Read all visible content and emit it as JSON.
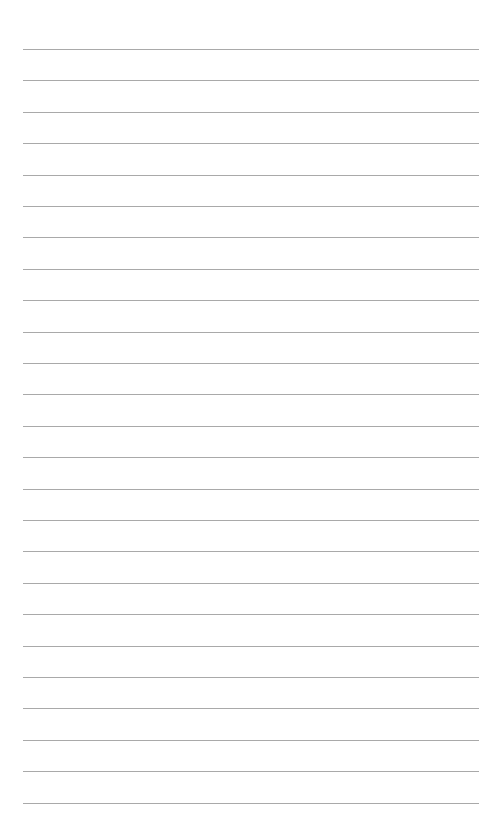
{
  "page": {
    "type": "lined-paper",
    "background_color": "#ffffff",
    "line_color": "#a9a9a9",
    "line_count": 25,
    "first_line_y": 49,
    "line_spacing": 31.4,
    "line_left": 23,
    "line_width": 456
  }
}
